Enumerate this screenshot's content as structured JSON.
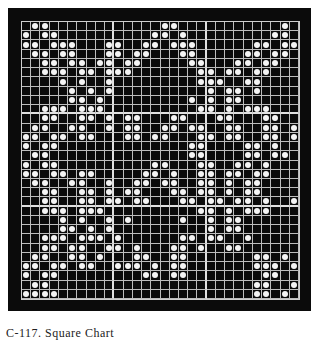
{
  "figure": {
    "caption": "C-117. Square Chart",
    "grid": {
      "cols": 30,
      "rows_count": 30,
      "major_every": 10,
      "background_color": "#0b0b0b",
      "line_color": "#bdbdbd",
      "dot_color": "#f4f4f4",
      "rows": [
        ".OO............OO...........O.",
        "O.OO..........OO.O.........OO.",
        "OO.OOO...OO..OO.OOO......OO.OO",
        ".OO.OO...OO.OO...OO.....OO.OO.",
        "..OO.OO.OO.OO.....OO...OO.OO..",
        "..OOO.OO.OOO.......OO.OO.OO...",
        "....O.O..O.........OOO..OO....",
        ".....O.O.O..........O.OO.O....",
        ".....OO.O.........O.O.OO......",
        "..OOO.OOO..........OO.O.OOO...",
        "..OO..OO.O.OO...OO...OO...OO..",
        ".OO..OO..O.OO..OO.OO..OO..OO.O",
        "OO.OO.OO...OO.OO...OO.OO..OO.O",
        "O.OO..............OO....OO.O..",
        ".OO...............OO....OO.OO.",
        "O.OO..........OO...OO..OO.O...",
        "OO.OO.OO.....OO.O..OO.OO.OO...",
        ".OO..OO..O..OO.OO..OO.O.OO....",
        "..OO..OO.O.OO...OO.OO.O.OO....",
        "..OO..OO.OO.OO...OO.OO.OO.O..O",
        "..OOO.OOO..........OO.O.OOO...",
        "....O.O..O.O.....O..O.OO......",
        "....OO.O.O..........O.OO......",
        "..OOO.OOO.O......OO.OO..O.....",
        "..OO.OO..OO.O...OO.O..OO......",
        ".OO..OO.O...OO..OO.......OO.O.",
        "OO.OO.OO..OOO.O.OO.......OOO.O",
        "O.OO.........OO.OO........OO..",
        ".OO......................OO..O",
        "OOOO.....................OO.O."
      ]
    }
  }
}
